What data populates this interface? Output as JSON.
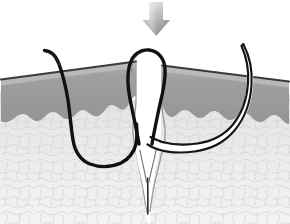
{
  "figure": {
    "title": "Suture placement through wound edges cross-section",
    "width": 290,
    "height": 224,
    "background_color": "#ffffff",
    "style": "grayscale line illustration"
  },
  "colors": {
    "background": "#ffffff",
    "epidermis_fill": "#9b9b9b",
    "epidermis_top_band": "#b4b4b4",
    "epidermis_outline": "#3c3c3c",
    "dermis_fill": "#e4e4e4",
    "dermis_outline": "#bdbdbd",
    "subcutis_fill": "#f1f1f1",
    "subcutis_outline": "#d8d8d8",
    "suture_thread": "#111111",
    "needle_outline": "#141414",
    "needle_body": "#ffffff",
    "wound_cleft": "#ffffff",
    "arrow_light": "#d8d8d8",
    "arrow_mid": "#a8a8a8",
    "arrow_dark": "#8f8f8f"
  },
  "elements": {
    "arrow": {
      "name": "downward compression arrow",
      "direction": "down",
      "x_center": 156,
      "y_top": 2,
      "y_bottom": 36,
      "shaft_width": 13,
      "head_width": 27
    },
    "left_skin_flap": {
      "name": "left wound edge",
      "layers": [
        "epidermis",
        "dermis",
        "subcutaneous tissue"
      ],
      "surface_y_at_left_edge": 78,
      "surface_y_at_wound": 62
    },
    "right_skin_flap": {
      "name": "right wound edge",
      "layers": [
        "epidermis",
        "dermis",
        "subcutaneous tissue"
      ],
      "surface_y_at_wound": 66,
      "surface_y_at_right_edge": 80
    },
    "wound": {
      "name": "wound cleft",
      "apex_y": 205,
      "opening_top_y": 62,
      "shape": "V-shaped tapering cleft"
    },
    "suture_loop": {
      "name": "suture thread loop above wound",
      "loop_top_y": 50,
      "loop_width": 36
    },
    "left_thread": {
      "name": "suture thread through left flap",
      "entry_point": [
        45,
        50
      ],
      "path": "enters left skin, curves deep through dermis, exits at wound base"
    },
    "needle": {
      "name": "curved surgical needle",
      "tip": [
        243,
        44
      ],
      "curvature": "semicircular",
      "rendering": "hollow double-line outline"
    }
  },
  "labels": {
    "caption": "",
    "annotations": []
  }
}
